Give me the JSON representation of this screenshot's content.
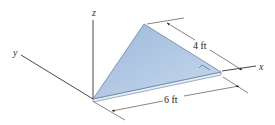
{
  "diagram": {
    "axes": {
      "x_label": "x",
      "y_label": "y",
      "z_label": "z"
    },
    "dimensions": {
      "hypotenuse_side": "4 ft",
      "base_side": "6 ft"
    },
    "plate": {
      "shape": "right triangle",
      "fill_color": "#a9c3e0",
      "edge_color": "#5a7899"
    },
    "line_color": "#333333"
  }
}
